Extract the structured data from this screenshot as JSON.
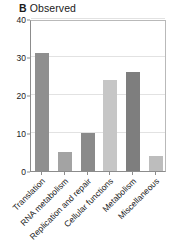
{
  "chart_data": {
    "type": "bar",
    "panel_letter": "B",
    "title_text": "Observed",
    "categories": [
      "Translation",
      "RNA metabolism",
      "Replication and repair",
      "Cellular functions",
      "Metabolism",
      "Miscellaneous"
    ],
    "values": [
      31,
      5,
      10,
      24,
      26,
      4
    ],
    "bar_colors": [
      "#8f8f8f",
      "#a3a3a3",
      "#8a8a8a",
      "#c6c6c6",
      "#7e7e7e",
      "#bdbdbd"
    ],
    "xlabel": "",
    "ylabel": "",
    "ylim": [
      0,
      40
    ],
    "yticks": [
      0,
      10,
      20,
      30,
      40
    ],
    "ytick_labels": [
      "0",
      "10",
      "20",
      "30",
      "40"
    ],
    "grid": true,
    "legend": false,
    "xtick_rotation": -45
  },
  "axis": {
    "frame_color": "#8c8c8c",
    "grid_color": "#e2e2e2"
  }
}
